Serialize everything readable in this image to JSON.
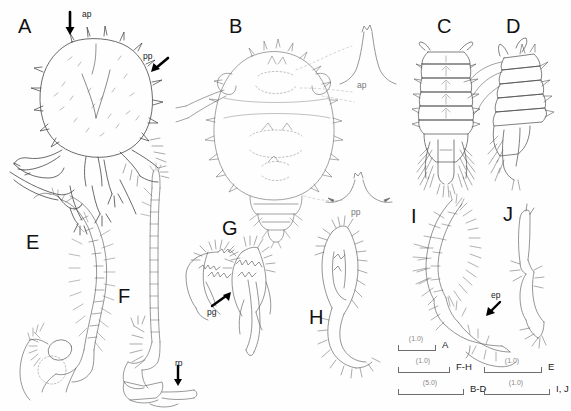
{
  "figure": {
    "kind": "taxonomic-illustration-plate",
    "background_color": "#fefefe",
    "ink_color": "#333333",
    "panel_count": 10
  },
  "panels": [
    {
      "id": "A",
      "label": "A",
      "x": 18,
      "y": 16,
      "caption_annotations": [
        "ap",
        "pp"
      ],
      "subject": "cephalothorax-dorsal-with-spines"
    },
    {
      "id": "B",
      "label": "B",
      "x": 229,
      "y": 16,
      "caption_annotations": [
        "ap",
        "pp"
      ],
      "subject": "body-dorsal-outline-with-marginal-spines"
    },
    {
      "id": "C",
      "label": "C",
      "x": 437,
      "y": 16,
      "caption_annotations": [],
      "subject": "pleon-dorsal-segments-uropods"
    },
    {
      "id": "D",
      "label": "D",
      "x": 506,
      "y": 16,
      "caption_annotations": [],
      "subject": "pleon-lateral-segments-uropods"
    },
    {
      "id": "E",
      "label": "E",
      "x": 26,
      "y": 232,
      "caption_annotations": [],
      "subject": "antenna-flagellum-with-setae"
    },
    {
      "id": "F",
      "label": "F",
      "x": 118,
      "y": 286,
      "caption_annotations": [
        "rp"
      ],
      "subject": "antennule-long-flagellum"
    },
    {
      "id": "G",
      "label": "G",
      "x": 222,
      "y": 218,
      "caption_annotations": [
        "pg"
      ],
      "subject": "mandible-pair-with-palp"
    },
    {
      "id": "H",
      "label": "H",
      "x": 309,
      "y": 307,
      "caption_annotations": [],
      "subject": "maxilliped-with-setae"
    },
    {
      "id": "I",
      "label": "I",
      "x": 411,
      "y": 206,
      "caption_annotations": [
        "ep"
      ],
      "subject": "pleopod-with-plumose-setae"
    },
    {
      "id": "J",
      "label": "J",
      "x": 503,
      "y": 204,
      "caption_annotations": [],
      "subject": "pereopod-slender-segments"
    }
  ],
  "annotations": [
    {
      "id": "a-ap",
      "text": "ap",
      "x": 82,
      "y": 10,
      "arrow": "down",
      "panel": "A"
    },
    {
      "id": "a-pp",
      "text": "pp",
      "x": 143,
      "y": 52,
      "arrow": "down-left",
      "panel": "A"
    },
    {
      "id": "b-ap",
      "text": "ap",
      "x": 357,
      "y": 81,
      "arrow": "none",
      "panel": "B",
      "muted": true
    },
    {
      "id": "b-pp",
      "text": "pp",
      "x": 351,
      "y": 208,
      "arrow": "none",
      "panel": "B",
      "muted": true
    },
    {
      "id": "g-pg",
      "text": "pg",
      "x": 207,
      "y": 308,
      "arrow": "up-right",
      "panel": "G"
    },
    {
      "id": "f-rp",
      "text": "rp",
      "x": 175,
      "y": 359,
      "arrow": "down",
      "panel": "F"
    },
    {
      "id": "i-ep",
      "text": "ep",
      "x": 491,
      "y": 291,
      "arrow": "down-left",
      "panel": "I"
    }
  ],
  "scale_bars": [
    {
      "id": "sb-a",
      "value": "(1.0)",
      "panels": "A",
      "x": 2,
      "y": 0,
      "width": 36
    },
    {
      "id": "sb-fh",
      "value": "(1.0)",
      "panels": "F-H",
      "x": 2,
      "y": 22,
      "width": 50
    },
    {
      "id": "sb-bd",
      "value": "(5.0)",
      "panels": "B-D",
      "x": 2,
      "y": 44,
      "width": 64
    },
    {
      "id": "sb-e",
      "value": "(1.0)",
      "panels": "E",
      "x": 88,
      "y": 22,
      "width": 56
    },
    {
      "id": "sb-ij",
      "value": "(1.0)",
      "panels": "I, J",
      "x": 88,
      "y": 44,
      "width": 64
    }
  ]
}
